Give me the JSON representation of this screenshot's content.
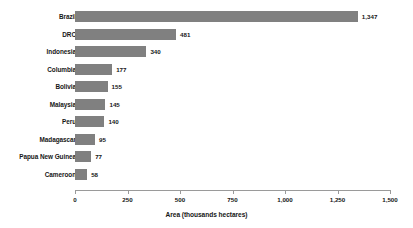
{
  "chart_data": {
    "type": "bar",
    "orientation": "horizontal",
    "title": "",
    "xlabel": "Area (thousands hectares)",
    "ylabel": "",
    "categories": [
      "Brazil",
      "DRC",
      "Indonesia",
      "Columbia",
      "Bolivia",
      "Malaysia",
      "Peru",
      "Madagascar",
      "Papua New Guinea",
      "Cameroon"
    ],
    "values": [
      1347,
      481,
      340,
      177,
      155,
      145,
      140,
      95,
      77,
      58
    ],
    "value_labels": [
      "1,347",
      "481",
      "340",
      "177",
      "155",
      "145",
      "140",
      "95",
      "77",
      "58"
    ],
    "xlim": [
      0,
      1500
    ],
    "xticks": [
      0,
      250,
      500,
      750,
      1000,
      1250,
      1500
    ],
    "xtick_labels": [
      "0",
      "250",
      "500",
      "750",
      "1,000",
      "1,250",
      "1,500"
    ],
    "grid": false,
    "legend": null,
    "bar_color": "#808080",
    "axis_color": "#9a9a9a",
    "text_color": "#161616"
  }
}
